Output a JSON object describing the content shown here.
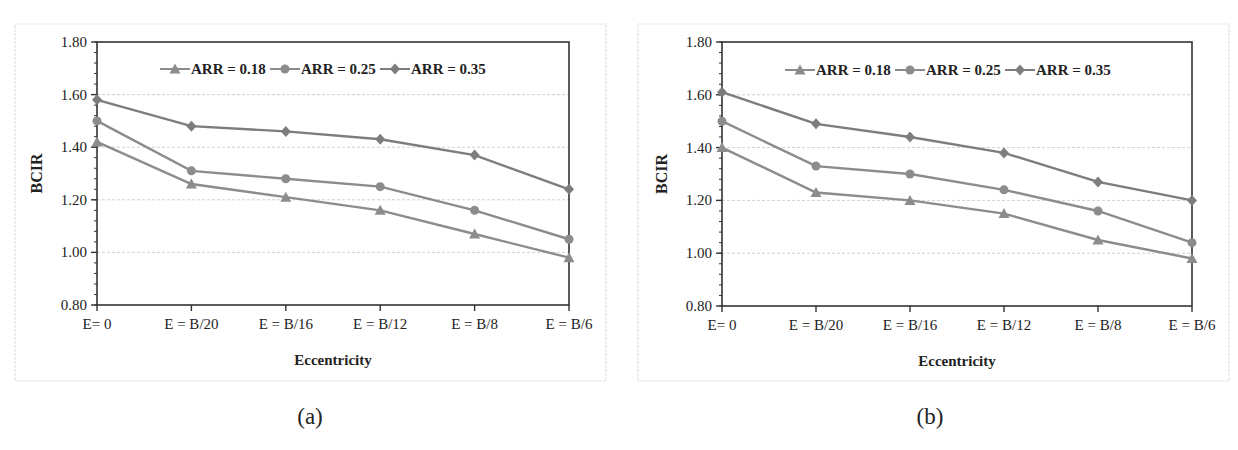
{
  "chart_data": [
    {
      "type": "line",
      "panel_label": "(a)",
      "title": "",
      "xlabel": "Eccentricity",
      "ylabel": "BCIR",
      "categories": [
        "E= 0",
        "E = B/20",
        "E = B/16",
        "E = B/12",
        "E = B/8",
        "E = B/6"
      ],
      "ylim": [
        0.8,
        1.8
      ],
      "yticks": [
        "0.80",
        "1.00",
        "1.20",
        "1.40",
        "1.60",
        "1.80"
      ],
      "grid": "horizontal dashed",
      "legend_position": "top inside",
      "series": [
        {
          "name": "ARR = 0.18",
          "marker": "triangle",
          "values": [
            1.42,
            1.26,
            1.21,
            1.16,
            1.07,
            0.98
          ]
        },
        {
          "name": "ARR = 0.25",
          "marker": "circle",
          "values": [
            1.5,
            1.31,
            1.28,
            1.25,
            1.16,
            1.05
          ]
        },
        {
          "name": "ARR = 0.35",
          "marker": "diamond",
          "values": [
            1.58,
            1.48,
            1.46,
            1.43,
            1.37,
            1.24
          ]
        }
      ]
    },
    {
      "type": "line",
      "panel_label": "(b)",
      "title": "",
      "xlabel": "Eccentricity",
      "ylabel": "BCIR",
      "categories": [
        "E= 0",
        "E = B/20",
        "E = B/16",
        "E = B/12",
        "E = B/8",
        "E = B/6"
      ],
      "ylim": [
        0.8,
        1.8
      ],
      "yticks": [
        "0.80",
        "1.00",
        "1.20",
        "1.40",
        "1.60",
        "1.80"
      ],
      "grid": "horizontal dashed",
      "legend_position": "top inside",
      "series": [
        {
          "name": "ARR = 0.18",
          "marker": "triangle",
          "values": [
            1.4,
            1.23,
            1.2,
            1.15,
            1.05,
            0.98
          ]
        },
        {
          "name": "ARR = 0.25",
          "marker": "circle",
          "values": [
            1.5,
            1.33,
            1.3,
            1.24,
            1.16,
            1.04
          ]
        },
        {
          "name": "ARR = 0.35",
          "marker": "diamond",
          "values": [
            1.61,
            1.49,
            1.44,
            1.38,
            1.27,
            1.2
          ]
        }
      ]
    }
  ],
  "colors": {
    "line": "#8c8c8c",
    "line_dark": "#7d7d7d",
    "axis": "#333333",
    "grid": "#d0d0d0",
    "frame": "#e2e2e2",
    "text": "#222222"
  },
  "captions": {
    "a": "(a)",
    "b": "(b)"
  }
}
